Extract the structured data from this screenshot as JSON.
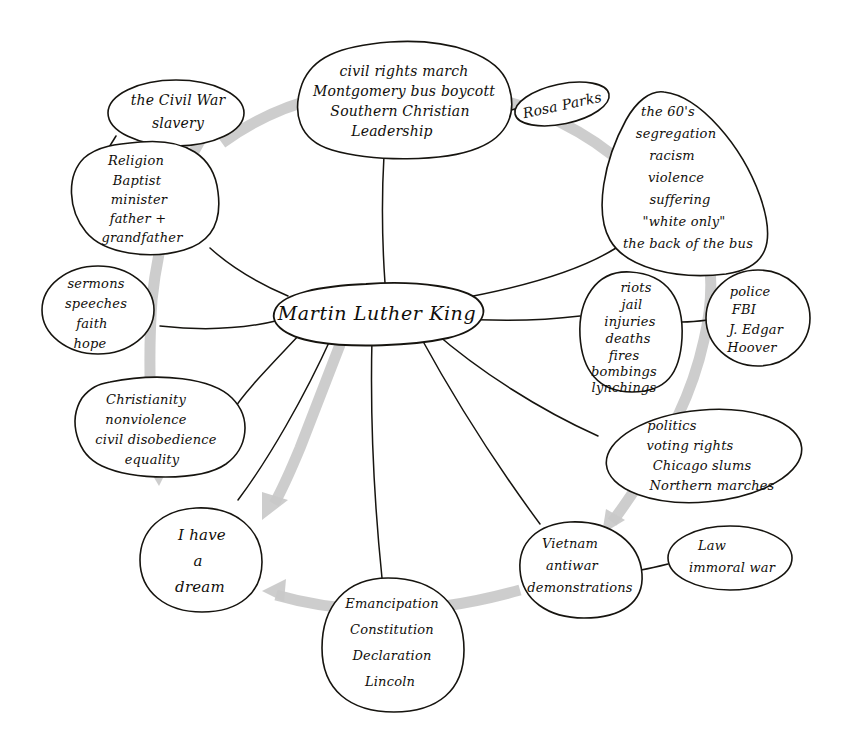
{
  "diagram": {
    "type": "hand-drawn-mind-map",
    "title": "Martin Luther King",
    "ink_color": "#16140f",
    "arrow_color": "#c9c9c9",
    "background_color": "#ffffff"
  },
  "center": {
    "label": "Martin Luther King"
  },
  "nodes": [
    {
      "id": "civil-rights-march",
      "lines": [
        "civil rights march",
        "Montgomery bus boycott",
        "Southern Christian",
        "Leadership"
      ]
    },
    {
      "id": "rosa-parks",
      "lines": [
        "Rosa Parks"
      ]
    },
    {
      "id": "the-civil-war",
      "lines": [
        "the Civil War",
        "slavery"
      ]
    },
    {
      "id": "religion",
      "lines": [
        "Religion",
        "Baptist",
        "minister",
        "father +",
        "grandfather"
      ]
    },
    {
      "id": "the-sixties",
      "lines": [
        "the 60's",
        "segregation",
        "racism",
        "violence",
        "suffering",
        "\"white only\"",
        "the back of the bus"
      ]
    },
    {
      "id": "sermons",
      "lines": [
        "sermons",
        "speeches",
        "faith",
        "hope"
      ]
    },
    {
      "id": "riots",
      "lines": [
        "riots",
        "jail",
        "injuries",
        "deaths",
        "fires",
        "bombings",
        "lynchings"
      ]
    },
    {
      "id": "police",
      "lines": [
        "police",
        "FBI",
        "J. Edgar",
        "Hoover"
      ]
    },
    {
      "id": "christianity",
      "lines": [
        "Christianity",
        "nonviolence",
        "civil disobedience",
        "equality"
      ]
    },
    {
      "id": "politics",
      "lines": [
        "politics",
        "voting rights",
        "Chicago slums",
        "Northern marches"
      ]
    },
    {
      "id": "i-have-a-dream",
      "lines": [
        "I have",
        "a",
        "dream"
      ]
    },
    {
      "id": "vietnam",
      "lines": [
        "Vietnam",
        "antiwar",
        "demonstrations"
      ]
    },
    {
      "id": "law",
      "lines": [
        "Law",
        "immoral war"
      ]
    },
    {
      "id": "emancipation",
      "lines": [
        "Emancipation",
        "Constitution",
        "Declaration",
        "Lincoln"
      ]
    }
  ]
}
